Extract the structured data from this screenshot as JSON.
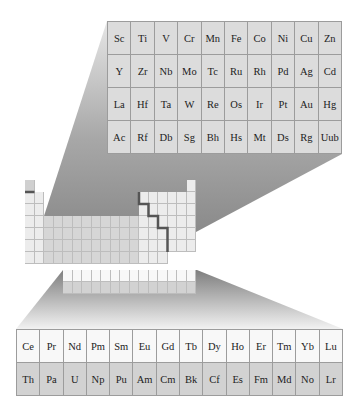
{
  "figure": {
    "type": "periodic-table-zoom-diagram",
    "colors": {
      "zoom_cell_fill": "#dcdcdc",
      "zoom_cell_border": "#9c9c9c",
      "lanthanide_row_fill": "#f8f8f8",
      "actinide_row_fill": "#d2d2d2",
      "mini_light_fill": "#ececec",
      "mini_d_block_fill": "#d6d6d6",
      "mini_h_fill": "#d0d0d0",
      "staircase_line": "#555555",
      "wedge_dark": "#7a7a7a",
      "wedge_light": "#ececec"
    }
  },
  "d_block_zoom": {
    "rows": [
      [
        "Sc",
        "Ti",
        "V",
        "Cr",
        "Mn",
        "Fe",
        "Co",
        "Ni",
        "Cu",
        "Zn"
      ],
      [
        "Y",
        "Zr",
        "Nb",
        "Mo",
        "Tc",
        "Ru",
        "Rh",
        "Pd",
        "Ag",
        "Cd"
      ],
      [
        "La",
        "Hf",
        "Ta",
        "W",
        "Re",
        "Os",
        "Ir",
        "Pt",
        "Au",
        "Hg"
      ],
      [
        "Ac",
        "Rf",
        "Db",
        "Sg",
        "Bh",
        "Hs",
        "Mt",
        "Ds",
        "Rg",
        "Uub"
      ]
    ]
  },
  "f_block_zoom": {
    "rows": [
      [
        "Ce",
        "Pr",
        "Nd",
        "Pm",
        "Sm",
        "Eu",
        "Gd",
        "Tb",
        "Dy",
        "Ho",
        "Er",
        "Tm",
        "Yb",
        "Lu"
      ],
      [
        "Th",
        "Pa",
        "U",
        "Np",
        "Pu",
        "Am",
        "Cm",
        "Bk",
        "Cf",
        "Es",
        "Fm",
        "Md",
        "No",
        "Lr"
      ]
    ]
  }
}
